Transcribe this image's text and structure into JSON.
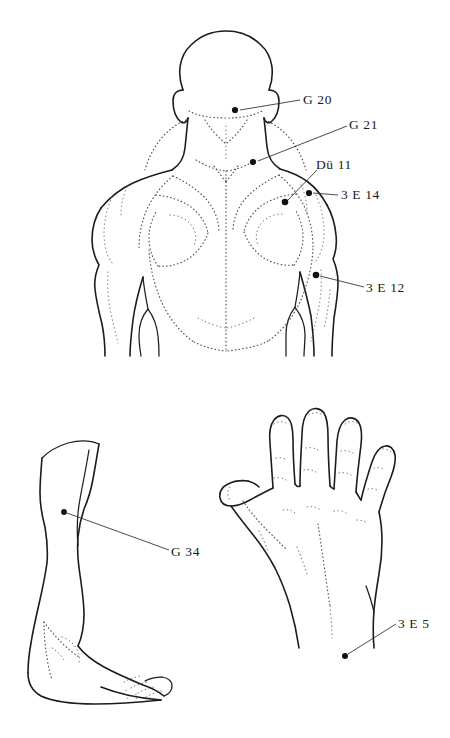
{
  "figure": {
    "background_color": "#ffffff",
    "ink_color": "#1c1c1c",
    "point_color": "#111111",
    "panels": [
      {
        "id": "upper-back",
        "name": "back-and-shoulders-view",
        "description": "Posterior view of head, neck, shoulders and upper back"
      },
      {
        "id": "lower-leg",
        "name": "lower-leg-lateral-view",
        "description": "Lateral view of lower leg and foot"
      },
      {
        "id": "hand",
        "name": "hand-dorsal-view",
        "description": "Dorsal view of right hand with spread fingers"
      }
    ]
  },
  "points": [
    {
      "id": "g20",
      "label": "G 20",
      "panel": "upper-back",
      "dot": {
        "x": 235,
        "y": 110
      },
      "label_pos": {
        "x": 305,
        "y": 93
      },
      "leader": {
        "x1": 240,
        "y1": 110,
        "x2": 300,
        "y2": 100
      }
    },
    {
      "id": "g21",
      "label": "G 21",
      "panel": "upper-back",
      "dot": {
        "x": 253,
        "y": 162
      },
      "label_pos": {
        "x": 351,
        "y": 118
      },
      "leader": {
        "x1": 258,
        "y1": 161,
        "x2": 347,
        "y2": 126
      }
    },
    {
      "id": "du11",
      "label": "Dü 11",
      "panel": "upper-back",
      "dot": {
        "x": 285,
        "y": 202
      },
      "label_pos": {
        "x": 315,
        "y": 158
      },
      "leader": {
        "x1": 288,
        "y1": 200,
        "x2": 317,
        "y2": 170
      }
    },
    {
      "id": "3e14",
      "label": "3 E 14",
      "panel": "upper-back",
      "dot": {
        "x": 309,
        "y": 193
      },
      "label_pos": {
        "x": 341,
        "y": 188
      },
      "leader": {
        "x1": 313,
        "y1": 193,
        "x2": 338,
        "y2": 195
      }
    },
    {
      "id": "3e12",
      "label": "3 E 12",
      "panel": "upper-back",
      "dot": {
        "x": 316,
        "y": 275
      },
      "label_pos": {
        "x": 367,
        "y": 281
      },
      "leader": {
        "x1": 320,
        "y1": 276,
        "x2": 364,
        "y2": 287
      }
    },
    {
      "id": "g34",
      "label": "G 34",
      "panel": "lower-leg",
      "dot": {
        "x": 64,
        "y": 512
      },
      "label_pos": {
        "x": 172,
        "y": 546
      },
      "leader": {
        "x1": 67,
        "y1": 513,
        "x2": 169,
        "y2": 550
      }
    },
    {
      "id": "3e5",
      "label": "3 E 5",
      "panel": "hand",
      "dot": {
        "x": 345,
        "y": 656
      },
      "label_pos": {
        "x": 399,
        "y": 617
      },
      "leader": {
        "x1": 348,
        "y1": 654,
        "x2": 396,
        "y2": 624
      }
    }
  ]
}
